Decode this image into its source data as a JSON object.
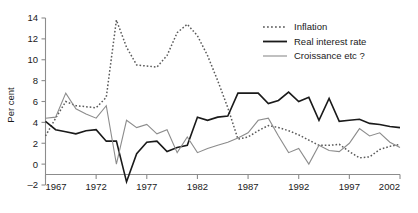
{
  "chart_data": {
    "type": "line",
    "title": "",
    "xlabel": "",
    "ylabel": "Per cent",
    "xlim": [
      1967,
      2002
    ],
    "ylim": [
      -2,
      14
    ],
    "grid": false,
    "legend_position": "top-right",
    "x": [
      1967,
      1968,
      1969,
      1970,
      1971,
      1972,
      1973,
      1974,
      1975,
      1976,
      1977,
      1978,
      1979,
      1980,
      1981,
      1982,
      1983,
      1984,
      1985,
      1986,
      1987,
      1988,
      1989,
      1990,
      1991,
      1992,
      1993,
      1994,
      1995,
      1996,
      1997,
      1998,
      1999,
      2000,
      2001,
      2002
    ],
    "xticks": [
      1967,
      1972,
      1977,
      1982,
      1987,
      1992,
      1997,
      2002
    ],
    "yticks": [
      -2,
      0,
      2,
      4,
      6,
      8,
      10,
      12,
      14
    ],
    "series": [
      {
        "name": "Inflation",
        "style": "dotted",
        "color": "#5a5a5a",
        "values": [
          2.7,
          4.4,
          6.0,
          5.6,
          5.5,
          5.4,
          6.4,
          13.8,
          11.2,
          9.5,
          9.4,
          9.3,
          10.4,
          12.6,
          13.4,
          12.3,
          10.4,
          8.0,
          5.4,
          2.4,
          2.6,
          3.2,
          3.7,
          3.5,
          3.2,
          2.8,
          2.3,
          1.8,
          1.8,
          1.9,
          1.2,
          0.6,
          0.7,
          1.4,
          1.7,
          1.9
        ]
      },
      {
        "name": "Real interest rate",
        "style": "solid",
        "color": "#1a1a1a",
        "values": [
          4.1,
          3.3,
          3.1,
          2.9,
          3.2,
          3.3,
          2.2,
          2.2,
          -1.7,
          1.0,
          2.1,
          2.2,
          1.2,
          1.6,
          1.8,
          4.5,
          4.2,
          4.5,
          4.6,
          6.8,
          6.8,
          6.8,
          5.8,
          6.1,
          6.9,
          6.0,
          6.4,
          4.2,
          6.3,
          4.1,
          4.2,
          4.3,
          3.9,
          3.8,
          3.6,
          3.5
        ]
      },
      {
        "name": "Croissance etc ?",
        "style": "solid-thin",
        "color": "#8c8c8c",
        "values": [
          4.4,
          4.5,
          6.8,
          5.3,
          4.8,
          4.4,
          5.6,
          0.0,
          4.2,
          3.5,
          3.8,
          2.9,
          3.3,
          1.1,
          2.6,
          1.1,
          1.5,
          1.8,
          2.1,
          2.5,
          3.0,
          4.2,
          4.4,
          2.7,
          1.1,
          1.5,
          0.0,
          1.8,
          1.3,
          1.2,
          2.0,
          3.4,
          2.7,
          3.0,
          2.1,
          1.6
        ]
      }
    ]
  },
  "legend": {
    "items": [
      {
        "label": "Inflation"
      },
      {
        "label": "Real interest rate"
      },
      {
        "label": "Croissance etc ?"
      }
    ]
  },
  "axes": {
    "y_title": "Per cent",
    "y_tick_labels": [
      "14",
      "12",
      "10",
      "8",
      "6",
      "4",
      "2",
      "0",
      "–2"
    ],
    "x_tick_labels": [
      "1967",
      "1972",
      "1977",
      "1982",
      "1987",
      "1992",
      "1997",
      "2002"
    ]
  }
}
